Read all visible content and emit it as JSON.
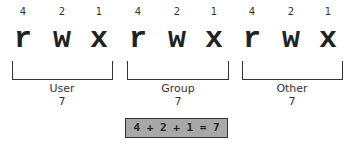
{
  "groups": [
    {
      "label": "User",
      "value": "7",
      "bits": [
        {
          "weight": "4",
          "letter": "r"
        },
        {
          "weight": "2",
          "letter": "w"
        },
        {
          "weight": "1",
          "letter": "x"
        }
      ]
    },
    {
      "label": "Group",
      "value": "7",
      "bits": [
        {
          "weight": "4",
          "letter": "r"
        },
        {
          "weight": "2",
          "letter": "w"
        },
        {
          "weight": "1",
          "letter": "x"
        }
      ]
    },
    {
      "label": "Other",
      "value": "7",
      "bits": [
        {
          "weight": "4",
          "letter": "r"
        },
        {
          "weight": "2",
          "letter": "w"
        },
        {
          "weight": "1",
          "letter": "x"
        }
      ]
    }
  ],
  "equation": "4 + 2 + 1 = 7",
  "colors": {
    "box_fill": "#a8a8a8",
    "stroke": "#333333"
  }
}
